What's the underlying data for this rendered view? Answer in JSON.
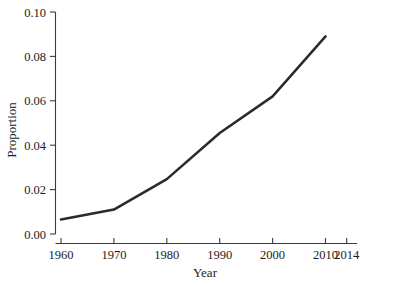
{
  "chart_data": {
    "type": "line",
    "title": "",
    "subtitle": "",
    "xlabel": "Year",
    "ylabel": "Proportion",
    "x": [
      1960,
      1970,
      1980,
      1990,
      2000,
      2010
    ],
    "values": [
      0.0065,
      0.011,
      0.0247,
      0.0455,
      0.062,
      0.089
    ],
    "series": [
      {
        "name": "Proportion",
        "x": [
          1960,
          1970,
          1980,
          1990,
          2000,
          2010
        ],
        "values": [
          0.0065,
          0.011,
          0.0247,
          0.0455,
          0.062,
          0.089
        ],
        "color": "#2a2a2a"
      }
    ],
    "xlim": [
      1960,
      2014
    ],
    "ylim": [
      0.0,
      0.1
    ],
    "xticks": [
      1960,
      1970,
      1980,
      1990,
      2000,
      2010,
      2014
    ],
    "xticklabels": [
      "1960",
      "1970",
      "1980",
      "1990",
      "2000",
      "2010",
      "2014"
    ],
    "yticks": [
      0.0,
      0.02,
      0.04,
      0.06,
      0.08,
      0.1
    ],
    "yticklabels": [
      "0.00",
      "0.02",
      "0.04",
      "0.06",
      "0.08",
      "0.10"
    ],
    "grid": false,
    "legend": false,
    "legend_position": "none",
    "line_width": 2.5,
    "colors": {
      "series": "#2a2a2a",
      "axis": "#3b3b3b",
      "text": "#1c1c1c",
      "background": "#ffffff"
    },
    "annotations": []
  }
}
